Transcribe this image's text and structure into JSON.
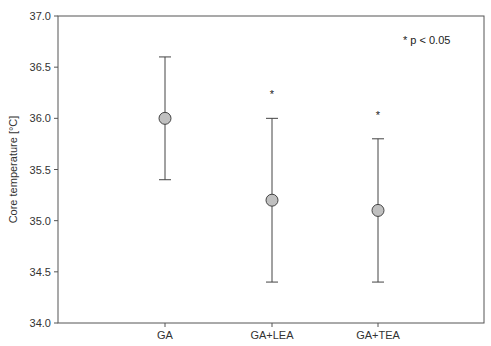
{
  "chart_data": {
    "type": "scatter",
    "subtype": "mean-with-error-bars",
    "title": "",
    "xlabel": "",
    "ylabel": "Core temperature [°C]",
    "ylim": [
      34.0,
      37.0
    ],
    "yticks": [
      "34.0",
      "34.5",
      "35.0",
      "35.5",
      "36.0",
      "36.5",
      "37.0"
    ],
    "categories": [
      "GA",
      "GA+LEA",
      "GA+TEA"
    ],
    "series": [
      {
        "name": "Core temperature",
        "values": [
          36.0,
          35.2,
          35.1
        ],
        "error_upper": [
          36.6,
          36.0,
          35.8
        ],
        "error_lower": [
          35.4,
          34.4,
          34.4
        ]
      }
    ],
    "significance_markers": [
      "",
      "*",
      "*"
    ],
    "annotation": "* p < 0.05",
    "grid": false,
    "legend": "none"
  },
  "colors": {
    "marker_fill": "#c0c0c0",
    "marker_stroke": "#444444",
    "axis": "#555555"
  }
}
